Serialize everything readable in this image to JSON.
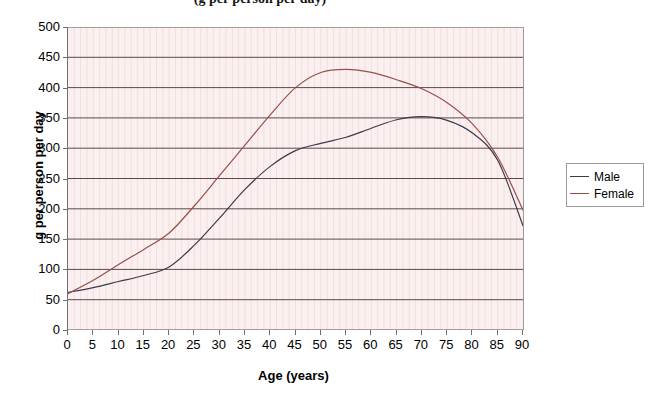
{
  "chart_data": {
    "type": "line",
    "title": "(g per person per day)",
    "xlabel": "Age (years)",
    "ylabel": "g per person per day",
    "xlim": [
      0,
      90
    ],
    "ylim": [
      0,
      500
    ],
    "xticks": [
      0,
      5,
      10,
      15,
      20,
      25,
      30,
      35,
      40,
      45,
      50,
      55,
      60,
      65,
      70,
      75,
      80,
      85,
      90
    ],
    "yticks": [
      0,
      50,
      100,
      150,
      200,
      250,
      300,
      350,
      400,
      450,
      500
    ],
    "grid": "horizontal-major-and-vertical-minor",
    "legend_position": "right",
    "x": [
      0,
      5,
      10,
      15,
      20,
      25,
      30,
      35,
      40,
      45,
      50,
      55,
      60,
      65,
      70,
      75,
      80,
      85,
      90
    ],
    "series": [
      {
        "name": "Male",
        "color": "#3b3b4a",
        "values": [
          62,
          70,
          80,
          90,
          104,
          140,
          185,
          232,
          270,
          296,
          308,
          318,
          333,
          347,
          352,
          346,
          325,
          280,
          172
        ]
      },
      {
        "name": "Female",
        "color": "#96504a",
        "values": [
          60,
          82,
          108,
          133,
          160,
          205,
          255,
          305,
          355,
          400,
          425,
          430,
          425,
          413,
          398,
          375,
          340,
          285,
          198
        ]
      }
    ],
    "annotations": {
      "male_peak_age": 67,
      "male_peak_value": 352,
      "female_peak_age": 53,
      "female_peak_value": 430
    }
  },
  "legend": {
    "items": [
      {
        "label": "Male"
      },
      {
        "label": "Female"
      }
    ]
  },
  "colors": {
    "plot_background": "#fbf0f0",
    "gridline": "#5a4a4a",
    "male_line": "#3b3b4a",
    "female_line": "#96504a",
    "axis": "#6f6f6f"
  }
}
